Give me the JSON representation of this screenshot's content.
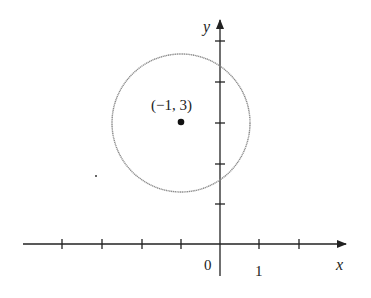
{
  "figure": {
    "type": "coordinate-plane-circle",
    "axes": {
      "x_label": "x",
      "y_label": "y",
      "origin_label": "0",
      "x_tick_label": "1"
    },
    "circle": {
      "center_label": "(−1, 3)",
      "center": [
        -1,
        3
      ],
      "radius_units": 1.75,
      "stroke_color": "#8a8a8a"
    },
    "colors": {
      "axis": "#222222",
      "point": "#111111"
    }
  }
}
